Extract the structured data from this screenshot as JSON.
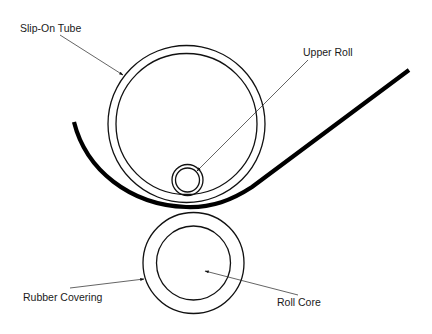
{
  "diagram": {
    "type": "roll-nip schematic",
    "labels": {
      "slip_on_tube": "Slip-On Tube",
      "upper_roll": "Upper Roll",
      "rubber_covering": "Rubber Covering",
      "roll_core": "Roll Core"
    },
    "components": [
      {
        "name": "Slip-On Tube",
        "shape": "double circle",
        "center": [
          186,
          124
        ],
        "outer_radius": 78,
        "inner_radius": 70
      },
      {
        "name": "Upper Roll",
        "shape": "double circle",
        "center": [
          187,
          180
        ],
        "outer_radius": 15.5,
        "inner_radius": 12
      },
      {
        "name": "Rubber Covering",
        "shape": "circle",
        "center": [
          193,
          263
        ],
        "radius": 50
      },
      {
        "name": "Roll Core",
        "shape": "circle",
        "center": [
          193,
          263
        ],
        "radius": 37
      },
      {
        "name": "Web / Belt",
        "shape": "thick curved line",
        "from": [
          74,
          122
        ],
        "to": [
          409,
          70
        ]
      }
    ],
    "colors": {
      "background": "#ffffff",
      "lines": "#000000",
      "text": "#1a1a1a"
    }
  }
}
